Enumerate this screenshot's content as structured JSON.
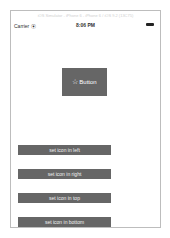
{
  "window": {
    "title": "iOS Simulator - iPhone 6 - iPhone 6 / iOS 9.2 (13C75)"
  },
  "status_bar": {
    "carrier": "Carrier ⦿",
    "time": "8:06 PM",
    "battery_icon": "battery-icon"
  },
  "main_button": {
    "icon": "☆",
    "label": "Button"
  },
  "buttons": [
    {
      "label": "set icon in left"
    },
    {
      "label": "set icon in right"
    },
    {
      "label": "set icon in top"
    },
    {
      "label": "set icon in bottom"
    }
  ],
  "colors": {
    "button_bg": "#666666",
    "button_text": "#ffffff",
    "background": "#ffffff"
  }
}
